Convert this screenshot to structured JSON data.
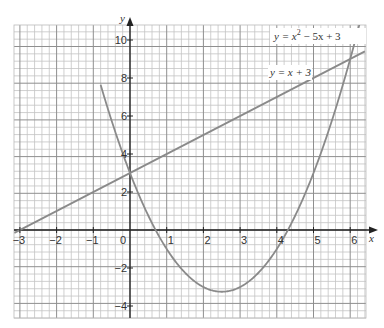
{
  "chart_data": {
    "type": "line",
    "title": "",
    "xlabel": "x",
    "ylabel": "y",
    "xlim": [
      -3.15,
      6.4
    ],
    "ylim": [
      -4.6,
      10.8
    ],
    "grid": true,
    "x_ticks": [
      -3,
      -2,
      -1,
      0,
      1,
      2,
      3,
      4,
      5,
      6
    ],
    "x_tick_labels": [
      "−3",
      "−2",
      "−1",
      "0",
      "1",
      "2",
      "3",
      "4",
      "5",
      "6"
    ],
    "y_ticks": [
      -4,
      -2,
      2,
      4,
      6,
      8,
      10
    ],
    "y_tick_labels": [
      "−4",
      "−2",
      "2",
      "4",
      "6",
      "8",
      "10"
    ],
    "series": [
      {
        "name": "y = x² − 5x + 3",
        "label_parts": {
          "pre": "y = x",
          "sup": "2",
          "post": " − 5x + 3"
        },
        "kind": "parabola",
        "coefficients": {
          "a": 1,
          "b": -5,
          "c": 3
        },
        "x": [
          -0.5,
          0,
          0.5,
          1,
          1.5,
          2,
          2.5,
          3,
          3.5,
          4,
          4.5,
          5,
          5.5,
          6,
          6.3
        ],
        "values": [
          5.75,
          3,
          0.75,
          -1,
          -2.25,
          -3,
          -3.25,
          -3,
          -2.25,
          -1,
          0.75,
          3,
          5.75,
          9,
          11.19
        ],
        "color": "#8a8a8a"
      },
      {
        "name": "y = x + 3",
        "kind": "line",
        "coefficients": {
          "m": 1,
          "c": 3
        },
        "x": [
          -3,
          6.4
        ],
        "values": [
          0,
          9.4
        ],
        "color": "#8a8a8a"
      }
    ],
    "annotations": [
      {
        "text": "y = x² − 5x + 3",
        "x": 4.3,
        "y": 10.3
      },
      {
        "text": "y = x + 3",
        "x": 3.8,
        "y": 8.3
      }
    ]
  }
}
